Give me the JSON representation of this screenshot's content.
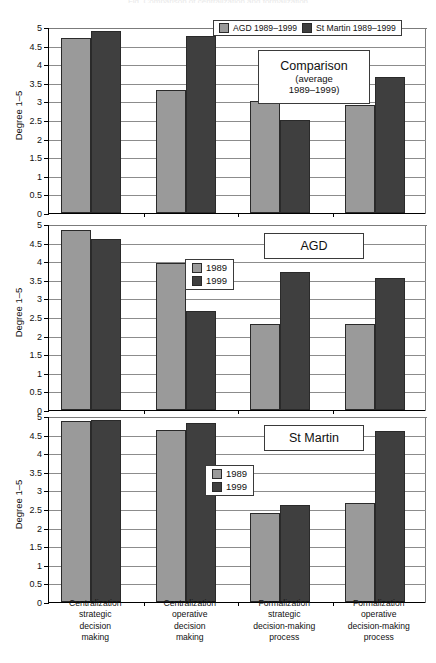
{
  "figure": {
    "width": 436,
    "height": 663,
    "background": "#ffffff",
    "series_colors": {
      "light": "#9a9a9a",
      "dark": "#3f3f3f"
    },
    "cropped_header_text": "Fig. Comparison of centralization and formalization"
  },
  "axis": {
    "y_title": "Degree 1–5",
    "y_ticks": [
      "0",
      "0.5",
      "1",
      "1.5",
      "2",
      "2.5",
      "3",
      "3.5",
      "4",
      "4.5",
      "5"
    ],
    "y_min": 0,
    "y_max": 5,
    "y_step": 0.5
  },
  "categories": [
    {
      "lines": [
        "Centralization",
        "strategic",
        "decision",
        "making"
      ]
    },
    {
      "lines": [
        "Centralization",
        "operative",
        "decision",
        "making"
      ]
    },
    {
      "lines": [
        "Formalization",
        "strategic",
        "decision-making",
        "process"
      ]
    },
    {
      "lines": [
        "Formalization",
        "operative",
        "decision-making",
        "process"
      ]
    }
  ],
  "panels": [
    {
      "id": "comparison",
      "box_label": {
        "big": "Comparison",
        "sub1": "(average",
        "sub2": "1989–1999)"
      },
      "legend": {
        "orientation": "horizontal",
        "items": [
          "AGD 1989–1999",
          "St Martin 1989–1999"
        ]
      }
    },
    {
      "id": "agd",
      "box_label": {
        "big": "AGD",
        "sub1": "",
        "sub2": ""
      },
      "legend": {
        "orientation": "vertical",
        "items": [
          "1989",
          "1999"
        ]
      }
    },
    {
      "id": "st-martin",
      "box_label": {
        "big": "St Martin",
        "sub1": "",
        "sub2": ""
      },
      "legend": {
        "orientation": "vertical",
        "items": [
          "1989",
          "1999"
        ]
      }
    }
  ],
  "chart_data": [
    {
      "type": "bar",
      "title": "Comparison (average 1989–1999)",
      "xlabel": "",
      "ylabel": "Degree 1–5",
      "ylim": [
        0,
        5
      ],
      "ytick_step": 0.5,
      "grid": true,
      "legend_position": "top-right",
      "categories": [
        "Centralization strategic decision making",
        "Centralization operative decision making",
        "Formalization strategic decision-making process",
        "Formalization operative decision-making process"
      ],
      "series": [
        {
          "name": "AGD 1989–1999",
          "color": "#9a9a9a",
          "values": [
            4.7,
            3.3,
            3.0,
            2.9
          ]
        },
        {
          "name": "St Martin 1989–1999",
          "color": "#3f3f3f",
          "values": [
            4.9,
            4.75,
            2.5,
            3.65
          ]
        }
      ]
    },
    {
      "type": "bar",
      "title": "AGD",
      "xlabel": "",
      "ylabel": "Degree 1–5",
      "ylim": [
        0,
        5
      ],
      "ytick_step": 0.5,
      "grid": true,
      "legend_position": "middle-center",
      "categories": [
        "Centralization strategic decision making",
        "Centralization operative decision making",
        "Formalization strategic decision-making process",
        "Formalization operative decision-making process"
      ],
      "series": [
        {
          "name": "1989",
          "color": "#9a9a9a",
          "values": [
            4.85,
            3.95,
            2.3,
            2.3
          ]
        },
        {
          "name": "1999",
          "color": "#3f3f3f",
          "values": [
            4.6,
            2.65,
            3.7,
            3.55
          ]
        }
      ]
    },
    {
      "type": "bar",
      "title": "St Martin",
      "xlabel": "",
      "ylabel": "Degree 1–5",
      "ylim": [
        0,
        5
      ],
      "ytick_step": 0.5,
      "grid": true,
      "legend_position": "middle-center",
      "categories": [
        "Centralization strategic decision making",
        "Centralization operative decision making",
        "Formalization strategic decision-making process",
        "Formalization operative decision-making process"
      ],
      "series": [
        {
          "name": "1989",
          "color": "#9a9a9a",
          "values": [
            4.87,
            4.62,
            2.4,
            2.65
          ]
        },
        {
          "name": "1999",
          "color": "#3f3f3f",
          "values": [
            4.9,
            4.82,
            2.6,
            4.6
          ]
        }
      ]
    }
  ]
}
